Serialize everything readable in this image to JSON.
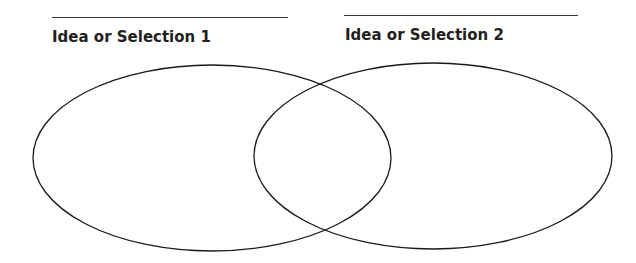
{
  "diagram": {
    "type": "venn",
    "sets": [
      {
        "label": "Idea or Selection 1",
        "answer_line": ""
      },
      {
        "label": "Idea or Selection 2",
        "answer_line": ""
      }
    ],
    "stroke_color": "#1a1a1a",
    "line_color": "#3a3a3a",
    "text_color": "#231f20"
  }
}
